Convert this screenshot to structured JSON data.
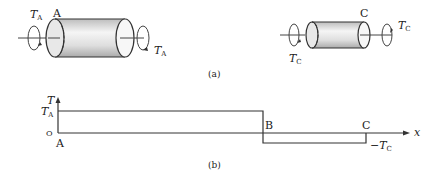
{
  "figure_a": {
    "caption": "(a)",
    "left_shaft": {
      "end_label": "A",
      "torque_label": "T",
      "torque_sub": "A",
      "torque_label_right": "T",
      "torque_sub_right": "A"
    },
    "right_shaft": {
      "end_label": "C",
      "torque_label": "T",
      "torque_sub": "C",
      "torque_label_left": "T",
      "torque_sub_left": "C"
    }
  },
  "figure_b": {
    "caption": "(b)",
    "y_axis_label": "T",
    "x_axis_label": "x",
    "y_tick_top": "T",
    "y_tick_top_sub": "A",
    "y_tick_zero": "O",
    "point_a": "A",
    "point_b": "B",
    "point_c": "C",
    "neg_label": "−T",
    "neg_label_sub": "C"
  },
  "colors": {
    "line": "#333333",
    "cyl_fill": "#dcdcdc",
    "cyl_light": "#f4f4f4"
  }
}
